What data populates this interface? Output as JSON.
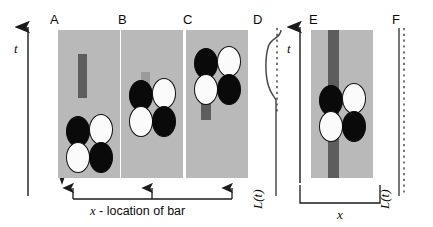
{
  "figure": {
    "type": "schematic-diagram",
    "axes": {
      "time_axis_label": "t",
      "time_axis_direction": "up",
      "space_axis_label": "x",
      "space_axis_direction": "right",
      "trace_axis_label": "L(t)"
    },
    "bracket": {
      "label_italic": "x",
      "label_rest": " - location of bar",
      "arrow_count": 3,
      "points_to": [
        "A",
        "B",
        "C"
      ]
    }
  },
  "colors": {
    "background": "#ffffff",
    "panel_gray": "#b9b9b9",
    "bar_dark": "#5d5d5d",
    "bar_dark_faint": "#9a9a9a",
    "ink": "#1a1a1a",
    "cell_black": "#0a0a0a",
    "cell_white": "#fbfbfb"
  },
  "panels": [
    {
      "id": "A",
      "label": "A",
      "kind": "cell-field",
      "bar": {
        "present": true,
        "position": "top-center",
        "length": "short",
        "shade": "dark"
      },
      "cells": [
        {
          "position": "top-left",
          "fill": "black"
        },
        {
          "position": "top-right",
          "fill": "white"
        },
        {
          "position": "bottom-left",
          "fill": "white"
        },
        {
          "position": "bottom-right",
          "fill": "black"
        }
      ],
      "marker_line": {
        "present": true,
        "corner": "top-left",
        "arrow": "down",
        "height": "low"
      },
      "bracket_arrow": true
    },
    {
      "id": "B",
      "label": "B",
      "kind": "cell-field",
      "bar": {
        "present": true,
        "position": "behind-cells",
        "length": "short",
        "shade": "faint"
      },
      "cells": [
        {
          "position": "top-left",
          "fill": "black"
        },
        {
          "position": "top-right",
          "fill": "white"
        },
        {
          "position": "bottom-left",
          "fill": "white"
        },
        {
          "position": "bottom-right",
          "fill": "black"
        }
      ],
      "marker_line": {
        "present": true,
        "corner": "top-left",
        "arrow": "down",
        "height": "mid"
      },
      "bracket_arrow": true
    },
    {
      "id": "C",
      "label": "C",
      "kind": "cell-field",
      "bar": {
        "present": true,
        "position": "under-lower-left-cell",
        "length": "medium",
        "shade": "dark"
      },
      "cells": [
        {
          "position": "top-left",
          "fill": "black"
        },
        {
          "position": "top-right",
          "fill": "white"
        },
        {
          "position": "bottom-left",
          "fill": "white"
        },
        {
          "position": "bottom-right",
          "fill": "black"
        }
      ],
      "marker_line": {
        "present": true,
        "corner": "top-left",
        "arrow": "down",
        "height": "high"
      },
      "bracket_arrow": true
    },
    {
      "id": "D",
      "label": "D",
      "kind": "trace",
      "trace": {
        "style": "solid-with-dashed-reference",
        "deviation": "s-shaped bulge to the left near top",
        "axis_label": "L(t)"
      }
    },
    {
      "id": "E",
      "label": "E",
      "kind": "cell-field",
      "bar": {
        "present": true,
        "position": "full-height-left-of-center",
        "length": "full",
        "shade": "dark"
      },
      "cells": [
        {
          "position": "top-left",
          "fill": "black"
        },
        {
          "position": "top-right",
          "fill": "white"
        },
        {
          "position": "bottom-left",
          "fill": "white"
        },
        {
          "position": "bottom-right",
          "fill": "black"
        }
      ],
      "marker_line": {
        "present": true,
        "corner": "top-left",
        "arrow": "down",
        "height": "mid"
      },
      "has_x_axis": true,
      "has_t_axis": true
    },
    {
      "id": "F",
      "label": "F",
      "kind": "trace",
      "trace": {
        "style": "solid-with-dashed-reference",
        "deviation": "none (straight)",
        "axis_label": "L(t)"
      }
    }
  ]
}
